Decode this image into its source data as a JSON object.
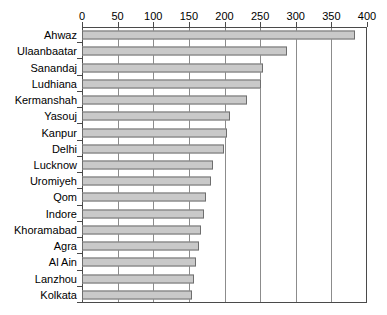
{
  "chart_data": {
    "type": "bar",
    "orientation": "horizontal",
    "title": "",
    "subtitle": "",
    "xlabel": "",
    "ylabel": "",
    "xlim": [
      0,
      400
    ],
    "ylim": null,
    "grid": true,
    "legend": null,
    "legend_position": "none",
    "xticks": [
      "0",
      "50",
      "100",
      "150",
      "200",
      "250",
      "300",
      "350",
      "400"
    ],
    "xtick_values": [
      0,
      50,
      100,
      150,
      200,
      250,
      300,
      350,
      400
    ],
    "categories": [
      "Ahwaz",
      "Ulaanbaatar",
      "Sanandaj",
      "Ludhiana",
      "Kermanshah",
      "Yasouj",
      "Kanpur",
      "Delhi",
      "Lucknow",
      "Uromiyeh",
      "Qom",
      "Indore",
      "Khoramabad",
      "Agra",
      "Al Ain",
      "Lanzhou",
      "Kolkata"
    ],
    "values": [
      383,
      288,
      254,
      251,
      232,
      208,
      204,
      199,
      184,
      181,
      174,
      171,
      167,
      164,
      160,
      157,
      154
    ],
    "colors": {
      "bar_fill": "#c9c9c9",
      "bar_border": "#6e6e6e",
      "gridline": "#8c8c8c",
      "axis": "#4a4a4a",
      "text": "#000000",
      "background": "#ffffff"
    }
  }
}
